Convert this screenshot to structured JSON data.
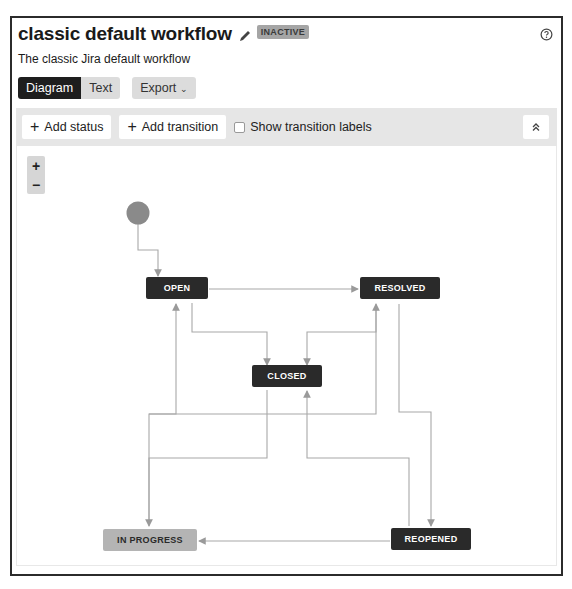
{
  "header": {
    "title": "classic default workflow",
    "status_badge": "INACTIVE",
    "description": "The classic Jira default workflow",
    "icons": {
      "edit": "pencil-icon",
      "help": "question-circle-icon"
    }
  },
  "view_tabs": [
    {
      "label": "Diagram",
      "active": true
    },
    {
      "label": "Text",
      "active": false
    }
  ],
  "export": {
    "label": "Export",
    "icon": "chevron-down-icon"
  },
  "toolbar": {
    "add_status": "Add status",
    "add_transition": "Add transition",
    "show_labels": {
      "label": "Show transition labels",
      "checked": false
    },
    "collapse_icon": "double-chevron-up-icon"
  },
  "zoom_controls": {
    "in": "+",
    "out": "−"
  },
  "diagram": {
    "statuses": [
      {
        "id": "open",
        "label": "OPEN",
        "style": "dark"
      },
      {
        "id": "resolved",
        "label": "RESOLVED",
        "style": "dark"
      },
      {
        "id": "closed",
        "label": "CLOSED",
        "style": "dark"
      },
      {
        "id": "inprogress",
        "label": "IN PROGRESS",
        "style": "light"
      },
      {
        "id": "reopened",
        "label": "REOPENED",
        "style": "dark"
      }
    ],
    "colors": {
      "dark_status": "#2a2a2a",
      "light_status": "#b4b4b4",
      "start_node": "#8a8a8a",
      "edge": "#a8a8a8"
    }
  }
}
